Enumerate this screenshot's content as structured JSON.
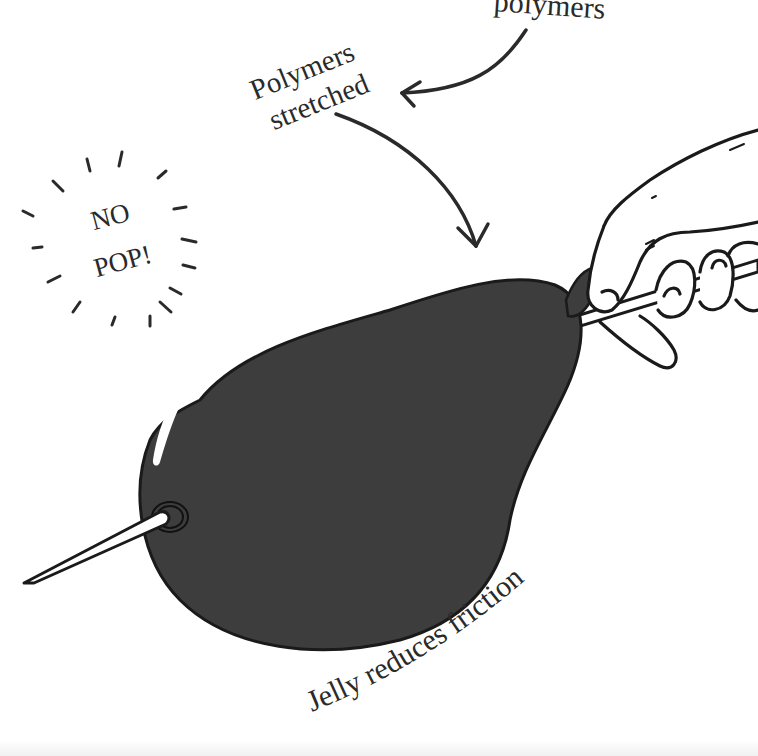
{
  "illustration": {
    "subject": "balloon pierced by skewer without popping",
    "labels": {
      "polymers_top": "polymers",
      "polymers_stretched_line1": "Polymers",
      "polymers_stretched_line2": "stretched",
      "no_pop_line1": "NO",
      "no_pop_line2": "POP!",
      "jelly": "Jelly reduces friction"
    },
    "icons": {
      "balloon": "balloon-icon",
      "skewer": "skewer-icon",
      "hand": "hand-icon",
      "arrow_polymers": "curved-arrow-icon",
      "arrow_stretched": "curved-arrow-icon",
      "burst_lines": "burst-lines-icon",
      "highlight": "balloon-highlight-icon",
      "puncture": "puncture-ring-icon"
    },
    "colors": {
      "balloon_fill": "#3d3d3d",
      "outline": "#1a1a1a",
      "text": "#2a2a2a",
      "background": "#ffffff",
      "highlight": "#ffffff"
    }
  }
}
